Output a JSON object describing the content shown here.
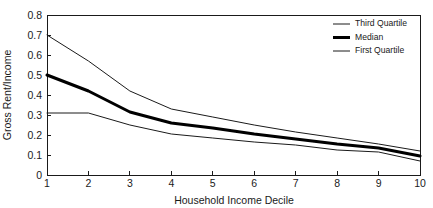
{
  "chart_data": {
    "type": "line",
    "title": "",
    "xlabel": "Household Income Decile",
    "ylabel": "Gross Rent/Income",
    "x": [
      1,
      2,
      3,
      4,
      5,
      6,
      7,
      8,
      9,
      10
    ],
    "xticklabels": [
      "1",
      "2",
      "3",
      "4",
      "5",
      "6",
      "7",
      "8",
      "9",
      "10"
    ],
    "yticklabels": [
      "0",
      "0.1",
      "0.2",
      "0.3",
      "0.4",
      "0.5",
      "0.6",
      "0.7",
      "0.8"
    ],
    "yticks": [
      0,
      0.1,
      0.2,
      0.3,
      0.4,
      0.5,
      0.6,
      0.7,
      0.8
    ],
    "xlim": [
      1,
      10
    ],
    "ylim": [
      0,
      0.8
    ],
    "grid": false,
    "legend_position": "top-right",
    "series": [
      {
        "name": "Third Quartile",
        "style": "thin",
        "color": "#1a1a1a",
        "width": 1,
        "values": [
          0.7,
          0.57,
          0.42,
          0.33,
          0.29,
          0.25,
          0.215,
          0.185,
          0.155,
          0.12
        ]
      },
      {
        "name": "Median",
        "style": "thick",
        "color": "#000000",
        "width": 3,
        "values": [
          0.5,
          0.42,
          0.315,
          0.26,
          0.235,
          0.205,
          0.18,
          0.155,
          0.135,
          0.095
        ]
      },
      {
        "name": "First Quartile",
        "style": "thin",
        "color": "#1a1a1a",
        "width": 1,
        "values": [
          0.31,
          0.31,
          0.25,
          0.205,
          0.185,
          0.165,
          0.15,
          0.125,
          0.115,
          0.07
        ]
      }
    ]
  },
  "legend": {
    "entries": [
      {
        "label": "Third Quartile"
      },
      {
        "label": "Median"
      },
      {
        "label": "First Quartile"
      }
    ]
  },
  "axes": {
    "x_title": "Household Income Decile",
    "y_title": "Gross Rent/Income"
  }
}
